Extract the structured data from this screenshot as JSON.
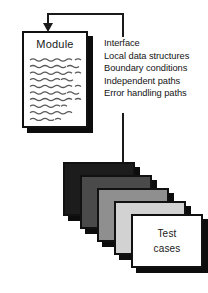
{
  "diagram": {
    "module": {
      "label": "Module",
      "body_placeholder": "squiggly-text-lines"
    },
    "checklist": {
      "items": [
        {
          "label": "Interface"
        },
        {
          "label": "Local data structures"
        },
        {
          "label": "Boundary conditions"
        },
        {
          "label": "Independent paths"
        },
        {
          "label": "Error handling paths"
        }
      ]
    },
    "connector": {
      "arrow_icon": "arrow-down-icon",
      "line_color": "#1a1a1a"
    },
    "test_cases": {
      "front_label_line1": "Test",
      "front_label_line2": "cases",
      "cards": [
        {
          "name": "card-1",
          "fill": "#1c1c1c"
        },
        {
          "name": "card-2",
          "fill": "#4a4a4a"
        },
        {
          "name": "card-3",
          "fill": "#8f8f8f"
        },
        {
          "name": "card-4",
          "fill": "#d2d2d2"
        },
        {
          "name": "card-5",
          "fill": "#ffffff"
        }
      ]
    }
  }
}
